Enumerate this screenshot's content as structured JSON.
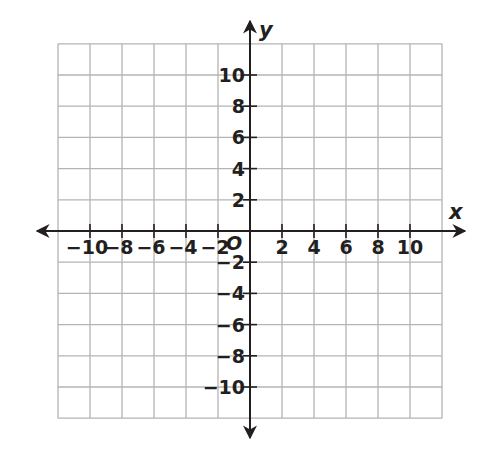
{
  "chart_data": {
    "type": "coordinate-grid",
    "title": "",
    "xlabel": "x",
    "ylabel": "y",
    "origin_label": "O",
    "xlim": [
      -12,
      12
    ],
    "ylim": [
      -12,
      12
    ],
    "grid": true,
    "grid_step": 2,
    "x_ticks": [
      -10,
      -8,
      -6,
      -4,
      -2,
      2,
      4,
      6,
      8,
      10
    ],
    "y_ticks": [
      -10,
      -8,
      -6,
      -4,
      -2,
      2,
      4,
      6,
      8,
      10
    ],
    "x_tick_labels": [
      "−10",
      "−8",
      "−6",
      "−4",
      "−2",
      "2",
      "4",
      "6",
      "8",
      "10"
    ],
    "y_tick_labels": [
      "−10",
      "−8",
      "−6",
      "−4",
      "−2",
      "2",
      "4",
      "6",
      "8",
      "10"
    ],
    "series": [],
    "legend": null
  },
  "colors": {
    "grid": "#b4b4b4",
    "axis": "#231f20",
    "text": "#231f20",
    "background": "#ffffff"
  },
  "layout": {
    "origin_px": [
      250,
      231
    ],
    "px_per_unit_x": 16,
    "px_per_unit_y": 15.6
  }
}
